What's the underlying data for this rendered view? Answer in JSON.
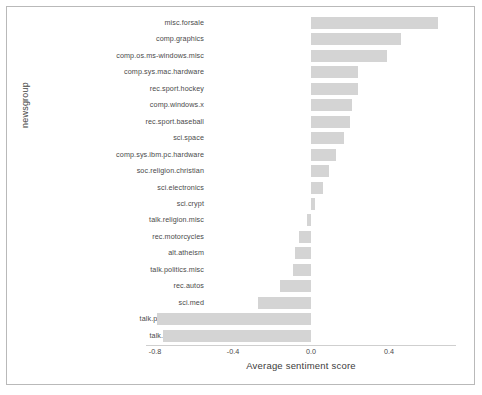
{
  "chart_data": {
    "type": "bar",
    "orientation": "horizontal",
    "title": "",
    "xlabel": "Average sentiment score",
    "ylabel": "newsgroup",
    "xlim": [
      -0.85,
      0.7
    ],
    "xticks": [
      -0.8,
      -0.4,
      0.0,
      0.4
    ],
    "xtick_labels": [
      "-0.8",
      "-0.4",
      "0.0",
      "0.4"
    ],
    "grid": false,
    "legend": null,
    "bar_color": "#d4d4d4",
    "categories": [
      "misc.forsale",
      "comp.graphics",
      "comp.os.ms-windows.misc",
      "comp.sys.mac.hardware",
      "rec.sport.hockey",
      "comp.windows.x",
      "rec.sport.baseball",
      "sci.space",
      "comp.sys.ibm.pc.hardware",
      "soc.religion.christian",
      "sci.electronics",
      "sci.crypt",
      "talk.religion.misc",
      "rec.motorcycles",
      "alt.atheism",
      "talk.politics.misc",
      "rec.autos",
      "sci.med",
      "talk.politics.mideast",
      "talk.politics.guns"
    ],
    "values": [
      0.65,
      0.46,
      0.39,
      0.24,
      0.24,
      0.21,
      0.2,
      0.17,
      0.13,
      0.09,
      0.06,
      0.02,
      -0.02,
      -0.06,
      -0.08,
      -0.09,
      -0.16,
      -0.27,
      -0.79,
      -0.76
    ]
  }
}
